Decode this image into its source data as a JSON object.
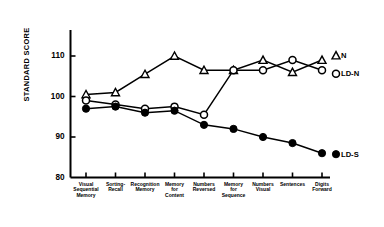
{
  "chart_data": {
    "type": "line",
    "title": "",
    "xlabel": "",
    "ylabel": "STANDARD SCORE",
    "ylim": [
      80,
      114
    ],
    "yticks": [
      80,
      90,
      100,
      110
    ],
    "grid": false,
    "legend_position": "right",
    "categories": [
      "Visual Sequential Memory",
      "Sorting-Recall",
      "Recognition Memory",
      "Memory for Content",
      "Numbers Reversed",
      "Memory for Sequence",
      "Numbers Visual",
      "Sentences",
      "Digits Forward"
    ],
    "category_lines": [
      [
        "Visual",
        "Sequential",
        "Memory"
      ],
      [
        "Sorting-",
        "Recall"
      ],
      [
        "Recognition",
        "Memory"
      ],
      [
        "Memory",
        "for",
        "Content"
      ],
      [
        "Numbers",
        "Reversed"
      ],
      [
        "Memory",
        "for",
        "Sequence"
      ],
      [
        "Numbers",
        "Visual"
      ],
      [
        "Sentences"
      ],
      [
        "Digits",
        "Forward"
      ]
    ],
    "series": [
      {
        "name": "N",
        "marker": "open-triangle",
        "color": "#000000",
        "values": [
          100.5,
          101.0,
          105.5,
          110.0,
          106.5,
          106.5,
          109.0,
          106.0,
          109.0
        ]
      },
      {
        "name": "LD-N",
        "marker": "open-circle",
        "color": "#000000",
        "values": [
          99.0,
          98.0,
          97.0,
          97.5,
          95.5,
          106.5,
          106.5,
          109.0,
          106.5
        ]
      },
      {
        "name": "LD-S",
        "marker": "filled-circle",
        "color": "#000000",
        "values": [
          97.0,
          97.5,
          96.0,
          96.5,
          93.0,
          92.0,
          90.0,
          88.5,
          86.0
        ]
      }
    ]
  },
  "legend": {
    "entries": [
      {
        "label": "N",
        "marker": "open-triangle"
      },
      {
        "label": "LD-N",
        "marker": "open-circle"
      },
      {
        "label": "LD-S",
        "marker": "filled-circle"
      }
    ]
  },
  "axis": {
    "y_label": "STANDARD SCORE",
    "y_tick_labels": [
      "110",
      "100",
      "90",
      "80"
    ]
  }
}
